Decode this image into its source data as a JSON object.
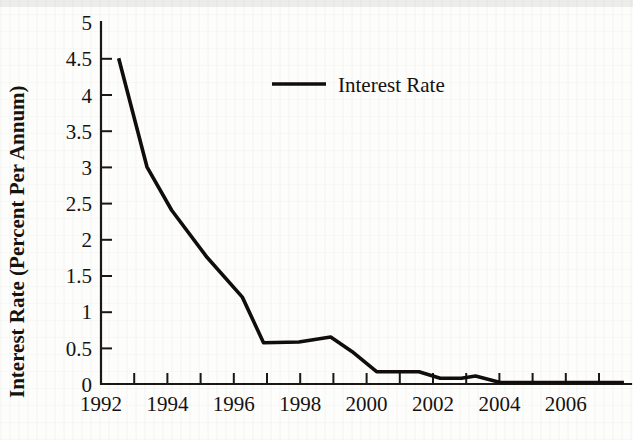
{
  "chart_data": {
    "type": "line",
    "title": "",
    "xlabel": "",
    "ylabel": "Interest Rate (Percent Per Annum)",
    "xlim": [
      1992,
      2007
    ],
    "ylim": [
      0,
      5
    ],
    "ytick_step": 0.5,
    "xtick_step": 1,
    "grid": false,
    "legend_position": "top-center",
    "series": [
      {
        "name": "Interest Rate",
        "color": "#100d0b",
        "x": [
          1992.5,
          1993.3,
          1994.0,
          1995.0,
          1996.0,
          1996.6,
          1997.6,
          1998.5,
          1999.1,
          1999.8,
          2001.0,
          2001.6,
          2002.2,
          2002.6,
          2003.3,
          2004.0,
          2005.0,
          2006.0,
          2006.8
        ],
        "y": [
          4.5,
          3.0,
          2.4,
          1.75,
          1.2,
          0.57,
          0.58,
          0.65,
          0.45,
          0.17,
          0.17,
          0.08,
          0.08,
          0.11,
          0.02,
          0.02,
          0.02,
          0.02,
          0.02
        ]
      }
    ],
    "xticks": [
      1992,
      1993,
      1994,
      1995,
      1996,
      1997,
      1998,
      1999,
      2000,
      2001,
      2002,
      2003,
      2004,
      2005,
      2006,
      2007
    ],
    "xtick_labels": [
      "1992",
      "",
      "1994",
      "",
      "1996",
      "",
      "1998",
      "",
      "2000",
      "",
      "2002",
      "",
      "2004",
      "",
      "2006",
      ""
    ],
    "yticks": [
      0,
      0.5,
      1,
      1.5,
      2,
      2.5,
      3,
      3.5,
      4,
      4.5,
      5
    ],
    "ytick_labels": [
      "0",
      "0.5",
      "1",
      "1.5",
      "2",
      "2.5",
      "3",
      "3.5",
      "4",
      "4.5",
      "5"
    ]
  },
  "legend": {
    "entries": [
      {
        "label": "Interest Rate"
      }
    ]
  },
  "axes": {
    "y_title": "Interest Rate (Percent Per Annum)"
  }
}
